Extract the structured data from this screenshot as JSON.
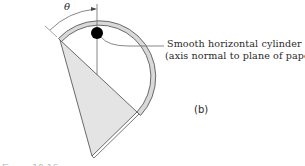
{
  "figure": {
    "angle_label": "θ",
    "callout_line1": "Smooth horizontal cylinder",
    "callout_line2": "(axis normal to plane of paper)",
    "part_label": "(b)",
    "caption_fragment": "Figure 10.16"
  },
  "colors": {
    "stroke": "#5a5a5a",
    "ring_fill": "#d9d9d9",
    "plate_fill": "#e4e4e4",
    "cylinder_fill": "#000000",
    "text": "#2a2a2a"
  },
  "geometry": {
    "ring_center": [
      97,
      77
    ],
    "ring_outer_radius": 54,
    "ring_inner_radius": 49,
    "cylinder_center": [
      97,
      34
    ],
    "cylinder_radius": 6,
    "triangle_vertices": [
      [
        60,
        40
      ],
      [
        137,
        112
      ],
      [
        92,
        156
      ]
    ]
  }
}
